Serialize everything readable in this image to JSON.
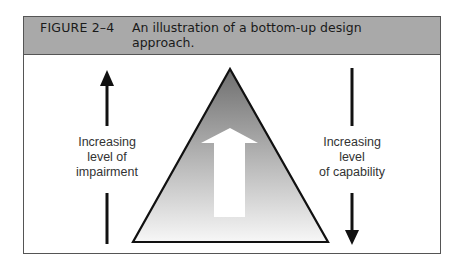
{
  "figure": {
    "number": "FIGURE 2–4",
    "caption": "An illustration of a bottom-up design approach."
  },
  "diagram": {
    "left_label": [
      "Increasing",
      "level of",
      "impairment"
    ],
    "right_label": [
      "Increasing",
      "level",
      "of capability"
    ],
    "left_arrow_direction": "up",
    "right_arrow_direction": "down",
    "center_shape": "triangle with upward arrow",
    "colors": {
      "header_bg": "#a9a9a9",
      "triangle_top": "#6e6e6e",
      "triangle_bottom": "#f5f5f5",
      "stroke": "#111111"
    }
  }
}
